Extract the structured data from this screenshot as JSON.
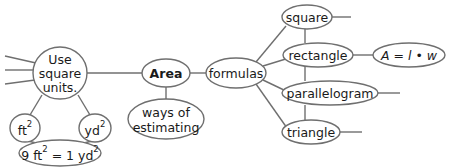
{
  "nodes": {
    "use_square_units": {
      "lines": [
        "Use",
        "square",
        "units."
      ]
    },
    "ft2": {
      "base": "ft",
      "sup": "2"
    },
    "yd2": {
      "base": "yd",
      "sup": "2"
    },
    "conversion": {
      "parts": [
        "9 ft",
        "2",
        " = 1 yd",
        "2"
      ]
    },
    "area": {
      "label": "Area"
    },
    "ways_of_estimating": {
      "lines": [
        "ways of",
        "estimating"
      ]
    },
    "formulas": {
      "label": "formulas"
    },
    "square": {
      "label": "square"
    },
    "rectangle": {
      "label": "rectangle"
    },
    "rectangle_formula": {
      "label": "A = l • w"
    },
    "parallelogram": {
      "label": "parallelogram"
    },
    "triangle": {
      "label": "triangle"
    }
  },
  "edges": [
    [
      "use_square_units",
      "area"
    ],
    [
      "use_square_units",
      "ft2"
    ],
    [
      "use_square_units",
      "yd2"
    ],
    [
      "ft2",
      "conversion"
    ],
    [
      "yd2",
      "conversion"
    ],
    [
      "area",
      "ways_of_estimating"
    ],
    [
      "area",
      "formulas"
    ],
    [
      "formulas",
      "square"
    ],
    [
      "formulas",
      "rectangle"
    ],
    [
      "formulas",
      "parallelogram"
    ],
    [
      "formulas",
      "triangle"
    ],
    [
      "square",
      "rectangle"
    ],
    [
      "rectangle",
      "parallelogram"
    ],
    [
      "parallelogram",
      "triangle"
    ],
    [
      "rectangle",
      "rectangle_formula"
    ]
  ]
}
